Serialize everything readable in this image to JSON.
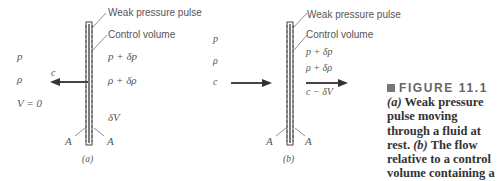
{
  "figure": {
    "panel_a": {
      "label": "(a)",
      "pulse_label": "Weak pressure pulse",
      "cv_label": "Control volume",
      "left": {
        "p": "p",
        "rho": "ρ",
        "V": "V = 0"
      },
      "right": {
        "p": "p + δp",
        "rho": "ρ + δρ",
        "dV": "δV"
      },
      "arrow_label": "c",
      "area_left": "A",
      "area_right": "A"
    },
    "panel_b": {
      "label": "(b)",
      "pulse_label": "Weak pressure pulse",
      "cv_label": "Control volume",
      "left": {
        "p": "p",
        "rho": "ρ",
        "c": "c"
      },
      "right": {
        "p": "p + δp",
        "rho": "ρ + δρ",
        "v": "c − δV"
      },
      "area_left": "A",
      "area_right": "A"
    },
    "caption": {
      "title": "FIGURE 11.1",
      "text_a_label": "(a)",
      "text_a": " Weak pressure pulse moving through a fluid at rest.",
      "text_b_label": "(b)",
      "text_b": " The flow relative to a control volume containing a weak pressure pulse."
    }
  }
}
